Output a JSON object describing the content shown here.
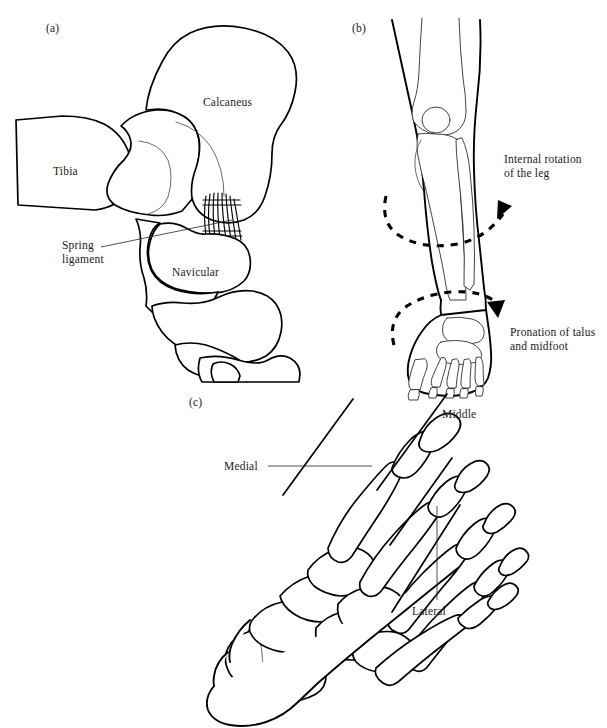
{
  "figure": {
    "background_color": "#ffffff",
    "line_color": "#000000",
    "text_color": "#1b1b1b",
    "width": 607,
    "height": 728
  },
  "panels": {
    "a": {
      "tag": "(a)",
      "description": "Medial view of ankle and hindfoot bones with spring ligament",
      "labels": {
        "tibia": "Tibia",
        "calcaneus": "Calcaneus",
        "navicular": "Navicular",
        "spring_ligament_line1": "Spring",
        "spring_ligament_line2": "ligament"
      }
    },
    "b": {
      "tag": "(b)",
      "description": "Anterior view of lower leg and foot showing rotation arrows",
      "labels": {
        "internal_rotation_line1": "Internal rotation",
        "internal_rotation_line2": "of the leg",
        "pronation_line1": "Pronation of talus",
        "pronation_line2": "and midfoot"
      }
    },
    "c": {
      "tag": "(c)",
      "description": "Dorsal view of foot skeleton divided into three columns",
      "labels": {
        "medial": "Medial",
        "middle": "Middle",
        "lateral": "Lateral"
      }
    }
  }
}
